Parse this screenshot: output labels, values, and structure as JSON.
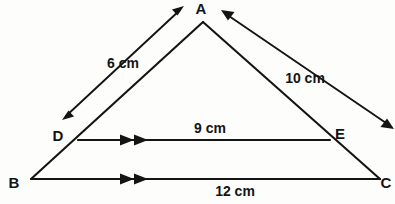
{
  "figure": {
    "kind": "geometry-diagram",
    "background_color": "#fdfdfb",
    "stroke_color": "#141414"
  },
  "vertices": {
    "a": {
      "label": "A",
      "x": 203,
      "y": 22,
      "label_x": 201,
      "label_y": 14
    },
    "b": {
      "label": "B",
      "x": 31,
      "y": 179,
      "label_x": 14,
      "label_y": 188
    },
    "c": {
      "label": "C",
      "x": 380,
      "y": 179,
      "label_x": 384,
      "label_y": 188
    },
    "d": {
      "label": "D",
      "x": 78,
      "y": 140,
      "label_x": 58,
      "label_y": 141
    },
    "e": {
      "label": "E",
      "x": 330,
      "y": 140,
      "label_x": 335,
      "label_y": 139
    }
  },
  "measurements": [
    {
      "id": "ad-length",
      "text": "6 cm",
      "label_x": 123,
      "label_y": 68,
      "arrow": {
        "x1": 62,
        "y1": 120,
        "x2": 184,
        "y2": 6,
        "heads": "both"
      }
    },
    {
      "id": "ac-length",
      "text": "10 cm",
      "label_x": 305,
      "label_y": 83,
      "arrow": {
        "x1": 221,
        "y1": 10,
        "x2": 393,
        "y2": 128,
        "heads": "both"
      }
    },
    {
      "id": "de-length",
      "text": "9 cm",
      "label_x": 210,
      "label_y": 133,
      "arrow": null
    },
    {
      "id": "bc-length",
      "text": "12 cm",
      "label_x": 235,
      "label_y": 196,
      "arrow": null
    }
  ],
  "segments": [
    {
      "id": "side-ab",
      "from": "a",
      "to": "b"
    },
    {
      "id": "side-ac",
      "from": "a",
      "to": "c"
    },
    {
      "id": "side-bc",
      "from": "b",
      "to": "c"
    },
    {
      "id": "segment-de",
      "from": "d",
      "to": "e"
    }
  ],
  "parallel_marks": [
    {
      "id": "de-parallel-mark",
      "on": "segment-de",
      "count": 2,
      "x": 128,
      "y": 140
    },
    {
      "id": "bc-parallel-mark",
      "on": "side-bc",
      "count": 2,
      "x": 128,
      "y": 179
    }
  ]
}
